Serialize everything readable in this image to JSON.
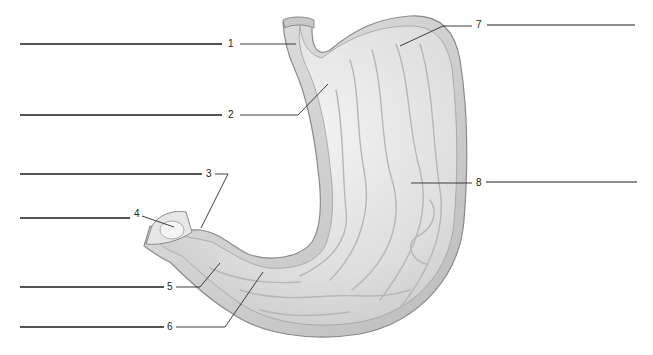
{
  "diagram": {
    "colors": {
      "tissue_light": "#ececec",
      "tissue_mid": "#d2d2d2",
      "tissue_dark": "#a8a8a8",
      "outline": "#8a8a8a",
      "line": "#1a1a1a"
    },
    "labels": [
      {
        "number": "1",
        "answer": ""
      },
      {
        "number": "2",
        "answer": ""
      },
      {
        "number": "3",
        "answer": ""
      },
      {
        "number": "4",
        "answer": ""
      },
      {
        "number": "5",
        "answer": ""
      },
      {
        "number": "6",
        "answer": ""
      },
      {
        "number": "7",
        "answer": ""
      },
      {
        "number": "8",
        "answer": ""
      }
    ]
  }
}
